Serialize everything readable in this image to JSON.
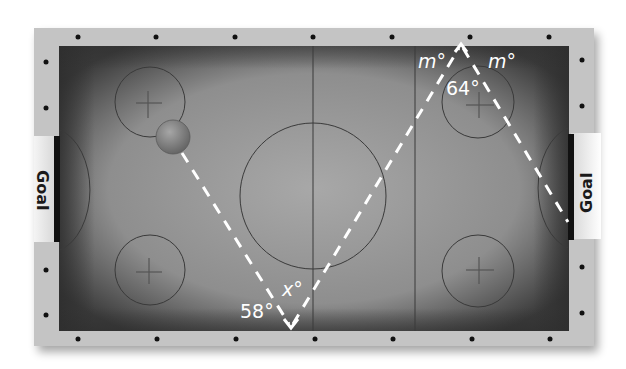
{
  "figure": {
    "type": "geometry-diagram",
    "labels": {
      "goal_left": "Goal",
      "goal_right": "Goal",
      "angle_bottom_known": "58°",
      "angle_bottom_unknown": "x°",
      "angle_top_left": "m°",
      "angle_top_right": "m°",
      "angle_top_vertex": "64°"
    },
    "colors": {
      "rail": "#c8c8c8",
      "playfield_center": "#9a9a9a",
      "playfield_edge": "#3c3c3c",
      "line": "#3a3a3a",
      "path": "#ffffff",
      "goal_bar": "#111111"
    }
  }
}
